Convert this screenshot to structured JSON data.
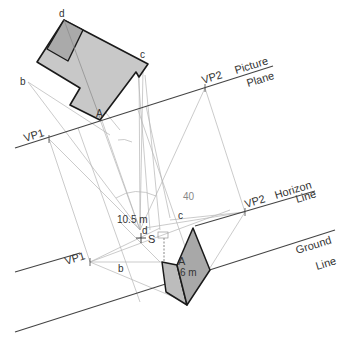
{
  "diagram": {
    "colors": {
      "plan_fill": "#c8c8c8",
      "plan_dark_fill": "#aaaaaa",
      "wall_fill": "#a8a8a8",
      "wall_side_fill": "#bcbcbc",
      "outline": "#1a1a1a",
      "main_line": "#444444",
      "construction_line": "#b0b0b0",
      "text": "#333333"
    },
    "lines": {
      "picture_plane": {
        "label_1": "Picture",
        "label_2": "Plane"
      },
      "horizon_line": {
        "label_1": "Horizon",
        "label_2": "Line"
      },
      "ground_line": {
        "label_1": "Ground",
        "label_2": "Line"
      }
    },
    "points": {
      "plan_d": "d",
      "plan_c": "c",
      "plan_b": "b",
      "plan_A": "A",
      "vp1_pp": "VP1",
      "vp2_pp": "VP2",
      "station_point": "S",
      "vp1_hl": "VP1",
      "vp2_hl": "VP2",
      "persp_c": "c",
      "persp_d": "d",
      "persp_b": "b",
      "persp_A": "A"
    },
    "dimensions": {
      "angle": "40",
      "height_above": "10.5 m",
      "wall_height": "6 m"
    }
  }
}
